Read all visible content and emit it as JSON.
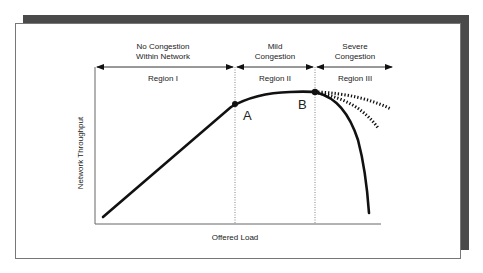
{
  "figure": {
    "regions": [
      {
        "title_line1": "No Congestion",
        "title_line2": "Within Network",
        "label": "Region I"
      },
      {
        "title_line1": "Mild",
        "title_line2": "Congestion",
        "label": "Region II"
      },
      {
        "title_line1": "Severe",
        "title_line2": "Congestion",
        "label": "Region III"
      }
    ],
    "points": [
      {
        "label": "A"
      },
      {
        "label": "B"
      }
    ],
    "axes": {
      "xlabel": "Offered Load",
      "ylabel": "Network Throughput"
    },
    "colors": {
      "curve": "#111111",
      "axis": "#555555",
      "shadow": "#4a4a4a"
    }
  }
}
